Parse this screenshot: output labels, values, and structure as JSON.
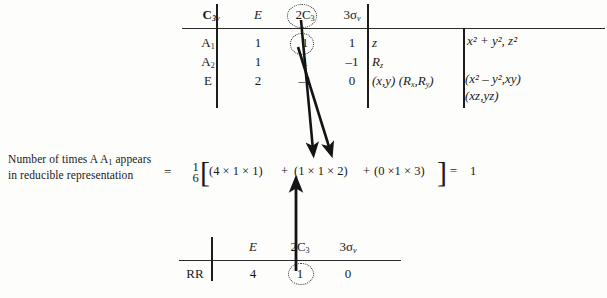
{
  "figure": {
    "background_color": "#fdfdfc",
    "ink_color": "#1c1c1c"
  },
  "character_table": {
    "name": "C3v character table",
    "point_group_label": "C",
    "point_group_sub": "3v",
    "operation_headers": [
      {
        "label": "E",
        "highlighted": false
      },
      {
        "label": "2C",
        "sub": "3",
        "highlighted": true
      },
      {
        "label": "3σ",
        "sub": "v",
        "highlighted": false
      }
    ],
    "rows": [
      {
        "symmetry_label": "A",
        "symmetry_sub": "1",
        "characters": [
          "1",
          "1",
          "1"
        ],
        "highlighted_character_index": 1,
        "linear_functions": "z",
        "quadratic_functions": [
          "x² + y², z²"
        ]
      },
      {
        "symmetry_label": "A",
        "symmetry_sub": "2",
        "characters": [
          "1",
          "1",
          "–1"
        ],
        "highlighted_character_index": -1,
        "linear_functions": "Rz",
        "quadratic_functions": []
      },
      {
        "symmetry_label": "E",
        "symmetry_sub": "",
        "characters": [
          "2",
          "–1",
          "0"
        ],
        "highlighted_character_index": -1,
        "linear_functions": "(x,y) (Rx,Ry)",
        "quadratic_functions": [
          "(x² – y²,xy)",
          "(xz,yz)"
        ]
      }
    ]
  },
  "caption": {
    "line1_prefix": "Number of times A",
    "line1_sub": "1",
    "line1_suffix": "appears",
    "line2": "in reducible representation"
  },
  "equation": {
    "equals_left": "=",
    "fraction_numerator": "1",
    "fraction_denominator": "6",
    "bracket_open": "[",
    "bracket_close": "]",
    "term1": "(4 × 1 × 1)",
    "plus1": "+",
    "term2": "(1 × 1 × 2)",
    "plus2": "+",
    "term3": "(0 ×1 × 3)",
    "equals_right": "=",
    "result": "1"
  },
  "reducible_table": {
    "name": "Reducible representation row",
    "row_label": "RR",
    "operation_headers": [
      {
        "label": "E",
        "sub": "",
        "highlighted": false
      },
      {
        "label": "2C",
        "sub": "3",
        "highlighted": false
      },
      {
        "label": "3σ",
        "sub": "v",
        "highlighted": false
      }
    ],
    "characters": [
      "4",
      "1",
      "0"
    ],
    "highlighted_character_index": 1
  },
  "arrows": [
    {
      "name": "arrow-from-2C3-header",
      "direction": "down",
      "from": [
        301,
        20
      ],
      "to": [
        313,
        153
      ]
    },
    {
      "name": "arrow-from-A1-character",
      "direction": "down",
      "from": [
        298,
        47
      ],
      "to": [
        331,
        153
      ]
    },
    {
      "name": "arrow-from-RR-character",
      "direction": "up",
      "from": [
        296,
        271
      ],
      "to": [
        296,
        181
      ]
    }
  ]
}
